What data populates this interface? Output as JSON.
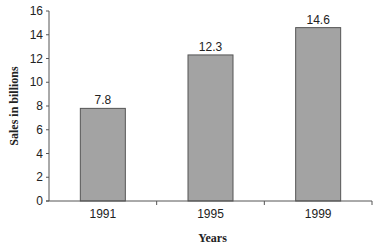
{
  "chart_data": {
    "type": "bar",
    "title": "",
    "xlabel": "Years",
    "ylabel": "Sales in billions",
    "categories": [
      "1991",
      "1995",
      "1999"
    ],
    "values": [
      7.8,
      12.3,
      14.6
    ],
    "data_labels": [
      "7.8",
      "12.3",
      "14.6"
    ],
    "ylim": [
      0,
      16
    ],
    "yticks": [
      0,
      2,
      4,
      6,
      8,
      10,
      12,
      14,
      16
    ],
    "grid": false,
    "legend": null,
    "bar_color": "#a3a3a3",
    "bar_edge_color": "#555555"
  }
}
